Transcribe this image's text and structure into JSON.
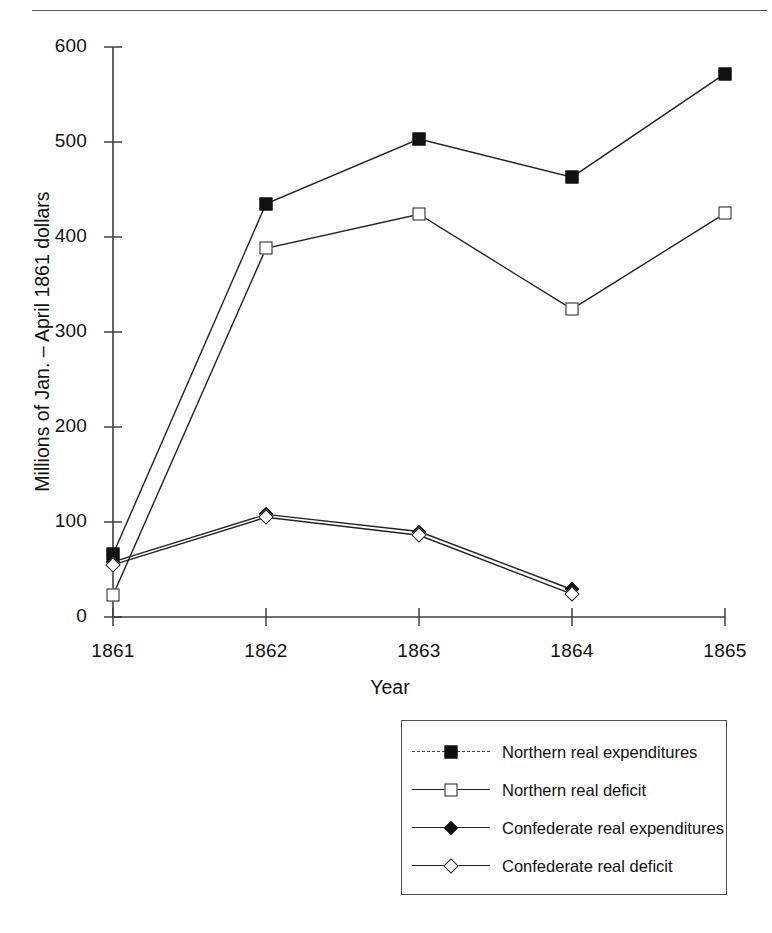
{
  "figure": {
    "ylabel": "Millions of Jan. – April 1861 dollars",
    "xlabel": "Year"
  },
  "axes": {
    "ytick_labels": [
      "600",
      "500",
      "400",
      "300",
      "200",
      "100",
      "0"
    ],
    "xtick_labels": [
      "1861",
      "1862",
      "1863",
      "1864",
      "1865"
    ]
  },
  "legend": {
    "items": [
      {
        "label": "Northern real expenditures",
        "marker": "filled-square-marker",
        "line": "dashed"
      },
      {
        "label": "Northern real deficit",
        "marker": "open-square-marker",
        "line": "solid"
      },
      {
        "label": "Confederate real expenditures",
        "marker": "filled-diamond-marker",
        "line": "solid"
      },
      {
        "label": "Confederate real deficit",
        "marker": "open-diamond-marker",
        "line": "solid"
      }
    ]
  },
  "chart_data": {
    "type": "line",
    "title": "",
    "xlabel": "Year",
    "ylabel": "Millions of Jan. – April 1861 dollars",
    "x": [
      1861,
      1862,
      1863,
      1864,
      1865
    ],
    "xlim": [
      1861,
      1865
    ],
    "ylim": [
      0,
      600
    ],
    "yticks": [
      0,
      100,
      200,
      300,
      400,
      500,
      600
    ],
    "grid": false,
    "legend_position": "below-right",
    "series": [
      {
        "name": "Northern real expenditures",
        "marker": "filled-square",
        "values": [
          66,
          435,
          503,
          463,
          572
        ]
      },
      {
        "name": "Northern real deficit",
        "marker": "open-square",
        "values": [
          23,
          388,
          424,
          324,
          425
        ]
      },
      {
        "name": "Confederate real expenditures",
        "marker": "filled-diamond",
        "values": [
          58,
          108,
          90,
          29,
          null
        ]
      },
      {
        "name": "Confederate real deficit",
        "marker": "open-diamond",
        "values": [
          55,
          105,
          86,
          24,
          null
        ]
      }
    ]
  }
}
